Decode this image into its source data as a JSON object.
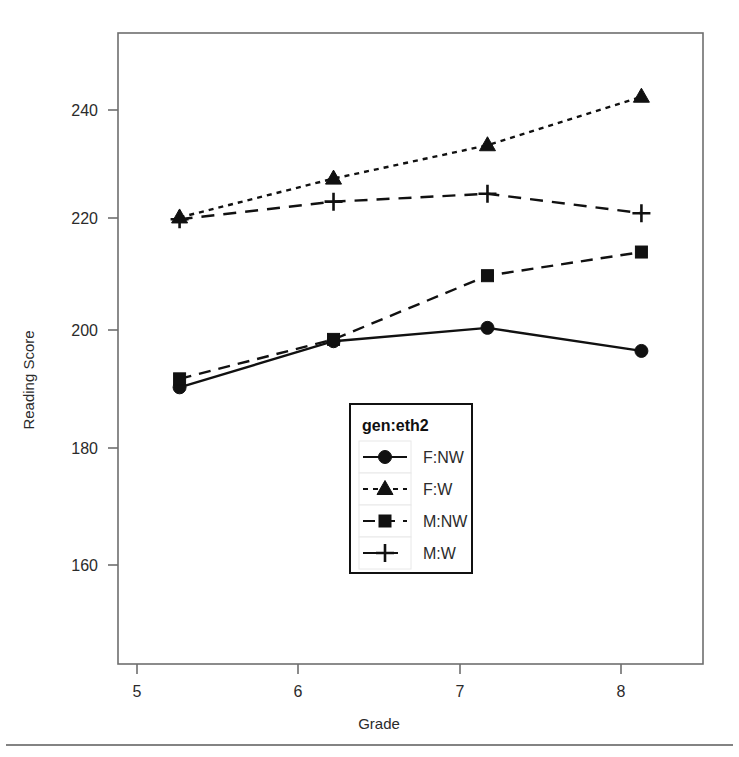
{
  "chart_data": {
    "type": "line",
    "title": "",
    "xlabel": "Grade",
    "ylabel": "Reading Score",
    "x": [
      5,
      6,
      7,
      8
    ],
    "xticklabels": [
      "5",
      "6",
      "7",
      "8"
    ],
    "yticks": [
      160,
      180,
      200,
      220,
      240
    ],
    "yticklabels": [
      "160",
      "180",
      "200",
      "220",
      "240"
    ],
    "xlim": [
      4.6,
      8.4
    ],
    "ylim": [
      148,
      252
    ],
    "grid": false,
    "legend_title": "gen:eth2",
    "legend_position": "center-bottom-inside",
    "series": [
      {
        "name": "F:NW",
        "marker": "circle",
        "linestyle": "solid",
        "color": "#111111",
        "values": [
          193.6,
          201.2,
          203.4,
          199.6
        ]
      },
      {
        "name": "F:W",
        "marker": "triangle",
        "linestyle": "dotted",
        "color": "#111111",
        "values": [
          221.6,
          228.0,
          233.5,
          241.5
        ]
      },
      {
        "name": "M:NW",
        "marker": "square",
        "linestyle": "dashed",
        "color": "#111111",
        "values": [
          195.0,
          201.5,
          212.0,
          215.9
        ]
      },
      {
        "name": "M:W",
        "marker": "plus",
        "linestyle": "dashed-long",
        "color": "#111111",
        "values": [
          221.3,
          224.2,
          225.5,
          222.3
        ]
      }
    ]
  },
  "figure": {
    "background": "#ffffff",
    "frame_color": "#6e6e6e",
    "text_color": "#2b2b2b",
    "has_bottom_rule": true
  }
}
